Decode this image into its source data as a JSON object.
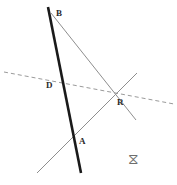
{
  "figure": {
    "canvas": {
      "width": 177,
      "height": 185,
      "background": "#ffffff"
    },
    "colors": {
      "thick_line": "#1a1a1a",
      "thin_line": "#8e8e8e",
      "dashed_line": "#9a9a9a",
      "label_text": "#2b2b2b",
      "mark": "#6e6e6e"
    },
    "points": [
      {
        "id": "B",
        "label": "B",
        "x": 50,
        "y": 12,
        "label_x": 56,
        "label_y": 9
      },
      {
        "id": "D",
        "label": "D",
        "x": 58,
        "y": 86,
        "label_x": 47,
        "label_y": 82
      },
      {
        "id": "A",
        "label": "A",
        "x": 76,
        "y": 143,
        "label_x": 79,
        "label_y": 138
      },
      {
        "id": "R",
        "label": "R",
        "x": 117,
        "y": 96,
        "label_x": 117,
        "label_y": 98
      }
    ],
    "segments": [
      {
        "id": "segment-BA-thick",
        "name": "thick-line-B-to-A",
        "style": "solid-thick",
        "color": "#1a1a1a",
        "width": 2.6,
        "x1": 48,
        "y1": 7,
        "x2": 81,
        "y2": 173
      },
      {
        "id": "segment-B-to-R",
        "name": "thin-line-B-through-R",
        "style": "solid-thin",
        "color": "#8e8e8e",
        "width": 1,
        "x1": 51,
        "y1": 13,
        "x2": 136,
        "y2": 120
      },
      {
        "id": "segment-A-to-R",
        "name": "thin-line-A-through-R",
        "style": "solid-thin",
        "color": "#8e8e8e",
        "width": 1,
        "x1": 37,
        "y1": 173,
        "x2": 137,
        "y2": 73
      },
      {
        "id": "segment-dashed",
        "name": "dashed-line-through-D-and-R",
        "style": "dashed",
        "color": "#9a9a9a",
        "width": 1,
        "dash": "4 3",
        "x1": 4,
        "y1": 72,
        "x2": 174,
        "y2": 104
      }
    ],
    "marks": [
      {
        "id": "bowtie-mark",
        "name": "hourglass-mark",
        "glyph": "⧖",
        "x": 128,
        "y": 153
      }
    ]
  }
}
